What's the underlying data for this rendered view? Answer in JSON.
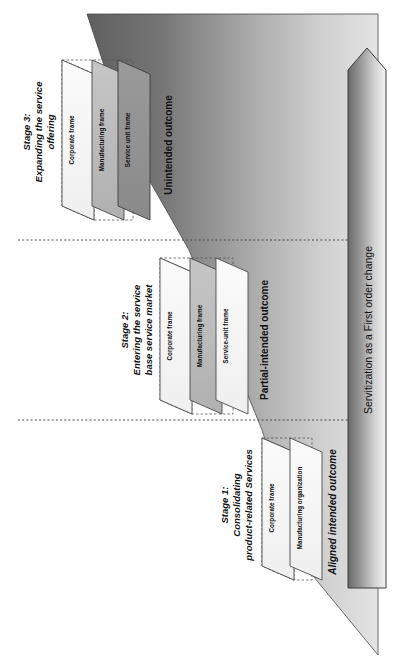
{
  "diagram": {
    "main_arrow_label": "Servitization as a First order change",
    "stages": [
      {
        "id": "stage-3",
        "title_line1": "Stage 3:",
        "title_line2": "Expanding the service",
        "title_line3": "offering",
        "outcome": "Unintended outcome",
        "panels": [
          "Corporate frame",
          "Manufacturing frame",
          "Service unit frame"
        ]
      },
      {
        "id": "stage-2",
        "title_line1": "Stage 2:",
        "title_line2": "Entering the service",
        "title_line3": "base service market",
        "outcome": "Partial-intended outcome",
        "panels": [
          "Corporate frame",
          "Manufacturing frame",
          "Service-unit frame"
        ]
      },
      {
        "id": "stage-1",
        "title_line1": "Stage 1:",
        "title_line2": "Consolidating",
        "title_line3": "product-related Services",
        "outcome": "Aligned intended outcome",
        "panels": [
          "Corporate frame",
          "Manufacturing organization"
        ]
      }
    ],
    "colors": {
      "wedge_dark": "#6a6a6a",
      "wedge_light": "#dcdcdc",
      "arrow_dark": "#6e6e6e",
      "arrow_light": "#f2f2f2",
      "panel_light": "#f7f7f7",
      "panel_mid": "#b8b8b8",
      "panel_dark": "#8f8f8f",
      "outline": "#3a3a3a",
      "divider": "#555555"
    }
  }
}
